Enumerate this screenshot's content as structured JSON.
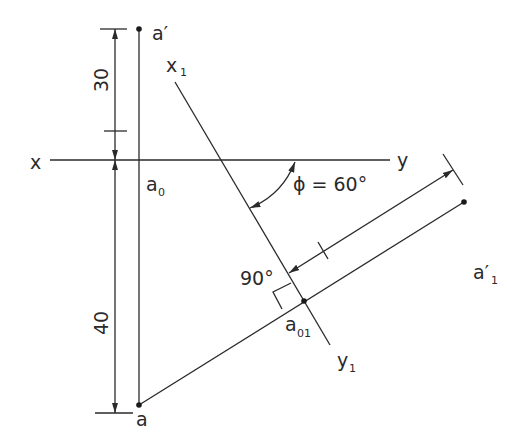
{
  "diagram": {
    "labels": {
      "a_prime": "a′",
      "x": "x",
      "y": "y",
      "x1_main": "x",
      "x1_sub": "1",
      "y1_main": "y",
      "y1_sub": "1",
      "a0_main": "a",
      "a0_sub": "0",
      "a": "a",
      "a01_main": "a",
      "a01_sub": "01",
      "a1p_main": "a′",
      "a1p_sub": "1",
      "phi": "ϕ = 60°",
      "right_angle": "90°"
    },
    "dimensions": {
      "upper": "30",
      "lower": "40"
    },
    "colors": {
      "line": "#2a2a2a",
      "background": "#ffffff"
    }
  }
}
